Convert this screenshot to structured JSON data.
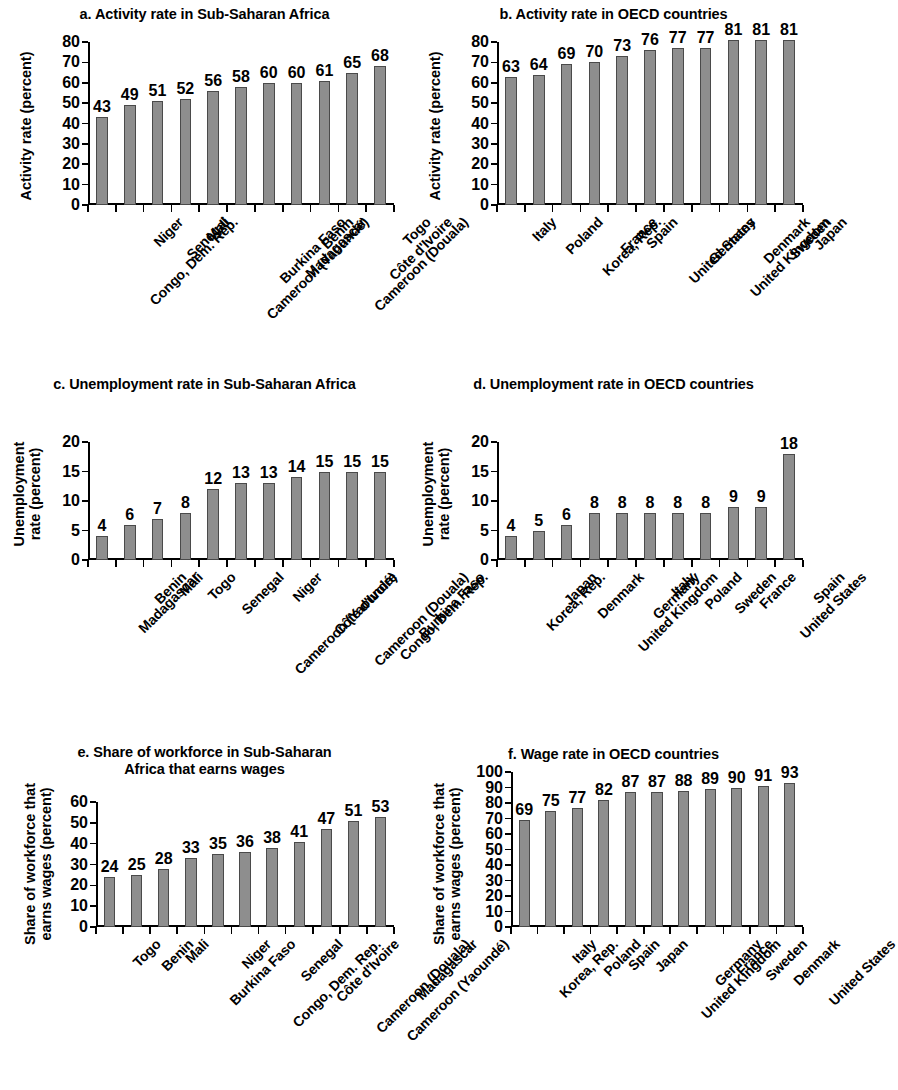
{
  "figure": {
    "background": "#ffffff",
    "bar_fill": "#8e8e8e",
    "bar_edge": "#4a4a4a",
    "axis_color": "#000000"
  },
  "chart_data": [
    {
      "id": "a",
      "type": "bar",
      "title": "a. Activity rate in Sub-Saharan Africa",
      "ylabel": "Activity rate (percent)",
      "xlabel": "",
      "ylim": [
        0,
        80
      ],
      "yticks": [
        0,
        10,
        20,
        30,
        40,
        50,
        60,
        70,
        80
      ],
      "grid": false,
      "legend": "none",
      "categories": [
        "Congo, Dem. Rep.",
        "Niger",
        "Senegal",
        "Mali",
        "Cameroon (Yaoundé)",
        "Burkina Faso",
        "Madagascar",
        "Benin",
        "Cameroon (Douala)",
        "Côte d'Ivoire",
        "Togo"
      ],
      "values": [
        43,
        49,
        51,
        52,
        56,
        58,
        60,
        60,
        61,
        65,
        68
      ]
    },
    {
      "id": "b",
      "type": "bar",
      "title": "b. Activity rate in OECD countries",
      "ylabel": "Activity rate (percent)",
      "xlabel": "",
      "ylim": [
        0,
        80
      ],
      "yticks": [
        0,
        10,
        20,
        30,
        40,
        50,
        60,
        70,
        80
      ],
      "grid": false,
      "legend": "none",
      "categories": [
        "Italy",
        "Poland",
        "Korea, Rep.",
        "France",
        "Spain",
        "United States",
        "Germany",
        "United Kingdom",
        "Denmark",
        "Sweden",
        "Japan"
      ],
      "values": [
        63,
        64,
        69,
        70,
        73,
        76,
        77,
        77,
        81,
        81,
        81
      ]
    },
    {
      "id": "c",
      "type": "bar",
      "title": "c. Unemployment rate in Sub-Saharan Africa",
      "ylabel": "Unemployment rate (percent)",
      "ylabel_lines": [
        "Unemployment",
        "rate (percent)"
      ],
      "xlabel": "",
      "ylim": [
        0,
        20
      ],
      "yticks": [
        0,
        5,
        10,
        15,
        20
      ],
      "grid": false,
      "legend": "none",
      "categories": [
        "Madagascar",
        "Benin",
        "Mali",
        "Togo",
        "Senegal",
        "Cameroon (Yaoundé)",
        "Niger",
        "Côte d'Ivoire",
        "Cameroon (Douala)",
        "Congo, Dem. Rep.",
        "Burkina Faso"
      ],
      "values": [
        4,
        6,
        7,
        8,
        12,
        13,
        13,
        14,
        15,
        15,
        15
      ]
    },
    {
      "id": "d",
      "type": "bar",
      "title": "d. Unemployment rate in OECD countries",
      "ylabel": "Unemployment rate (percent)",
      "ylabel_lines": [
        "Unemployment",
        "rate (percent)"
      ],
      "xlabel": "",
      "ylim": [
        0,
        20
      ],
      "yticks": [
        0,
        5,
        10,
        15,
        20
      ],
      "grid": false,
      "legend": "none",
      "categories": [
        "Korea, Rep.",
        "Japan",
        "Denmark",
        "United Kingdom",
        "Germany",
        "Italy",
        "Poland",
        "Sweden",
        "France",
        "United States",
        "Spain"
      ],
      "values": [
        4,
        5,
        6,
        8,
        8,
        8,
        8,
        8,
        9,
        9,
        18
      ]
    },
    {
      "id": "e",
      "type": "bar",
      "title": "e. Share of workforce in Sub-Saharan Africa that earns wages",
      "title_lines": [
        "e. Share of workforce in Sub-Saharan",
        "Africa that earns wages"
      ],
      "ylabel": "Share of workforce that earns wages (percent)",
      "ylabel_lines": [
        "Share of workforce that",
        "earns wages (percent)"
      ],
      "xlabel": "",
      "ylim": [
        0,
        60
      ],
      "yticks": [
        0,
        10,
        20,
        30,
        40,
        50,
        60
      ],
      "grid": false,
      "legend": "none",
      "categories": [
        "Togo",
        "Benin",
        "Mali",
        "Burkina Faso",
        "Niger",
        "Congo, Dem. Rep.",
        "Senegal",
        "Côte d'Ivoire",
        "Cameroon (Douala)",
        "Cameroon (Yaoundé)",
        "Madagascar"
      ],
      "values": [
        24,
        25,
        28,
        33,
        35,
        36,
        38,
        41,
        47,
        51,
        53
      ]
    },
    {
      "id": "f",
      "type": "bar",
      "title": "f. Wage rate in OECD countries",
      "ylabel": "Share of workforce that earns wages (percent)",
      "ylabel_lines": [
        "Share of workforce that",
        "earns wages (percent)"
      ],
      "xlabel": "",
      "ylim": [
        0,
        100
      ],
      "yticks": [
        0,
        10,
        20,
        30,
        40,
        50,
        60,
        70,
        80,
        90,
        100
      ],
      "grid": false,
      "legend": "none",
      "categories": [
        "Korea, Rep.",
        "Italy",
        "Poland",
        "Spain",
        "Japan",
        "United Kingdom",
        "Germany",
        "France",
        "Sweden",
        "Denmark",
        "United States"
      ],
      "values": [
        69,
        75,
        77,
        82,
        87,
        87,
        88,
        89,
        90,
        91,
        93
      ]
    }
  ]
}
